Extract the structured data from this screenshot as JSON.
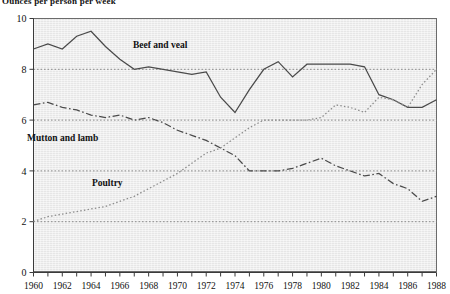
{
  "chart_data": {
    "type": "line",
    "title": "Ounces per person per week",
    "xlabel": "",
    "ylabel": "",
    "xlim": [
      1960,
      1988
    ],
    "ylim": [
      0,
      10
    ],
    "yticks": [
      0,
      2,
      4,
      6,
      8,
      10
    ],
    "xticks": [
      1960,
      1961,
      1962,
      1963,
      1964,
      1965,
      1966,
      1967,
      1968,
      1969,
      1970,
      1971,
      1972,
      1973,
      1974,
      1975,
      1976,
      1977,
      1978,
      1979,
      1980,
      1981,
      1982,
      1983,
      1984,
      1985,
      1986,
      1987,
      1988
    ],
    "xtick_labels": [
      "1960",
      "",
      "1962",
      "",
      "1964",
      "",
      "1966",
      "",
      "1968",
      "",
      "1970",
      "",
      "1972",
      "",
      "1974",
      "",
      "1976",
      "",
      "1978",
      "",
      "1980",
      "",
      "1982",
      "",
      "1984",
      "",
      "1986",
      "",
      "1988"
    ],
    "grid": true,
    "grid_axis": "y",
    "legend_position": "inline-annotations",
    "x": [
      1960,
      1961,
      1962,
      1963,
      1964,
      1965,
      1966,
      1967,
      1968,
      1969,
      1970,
      1971,
      1972,
      1973,
      1974,
      1975,
      1976,
      1977,
      1978,
      1979,
      1980,
      1981,
      1982,
      1983,
      1984,
      1985,
      1986,
      1987,
      1988
    ],
    "series": [
      {
        "name": "Beef and veal",
        "style": "solid",
        "color": "#4a4a4a",
        "values": [
          8.8,
          9.0,
          8.8,
          9.3,
          9.5,
          8.9,
          8.4,
          8.0,
          8.1,
          8.0,
          7.9,
          7.8,
          7.9,
          6.9,
          6.3,
          7.2,
          8.0,
          8.3,
          7.7,
          8.2,
          8.2,
          8.2,
          8.2,
          8.1,
          7.0,
          6.8,
          6.5,
          6.5,
          6.8
        ]
      },
      {
        "name": "Mutton and lamb",
        "style": "dash-dot",
        "color": "#4a4a4a",
        "values": [
          6.6,
          6.7,
          6.5,
          6.4,
          6.2,
          6.1,
          6.2,
          6.0,
          6.1,
          5.9,
          5.6,
          5.4,
          5.2,
          4.9,
          4.6,
          4.0,
          4.0,
          4.0,
          4.1,
          4.3,
          4.5,
          4.2,
          4.0,
          3.8,
          3.9,
          3.5,
          3.3,
          2.8,
          3.0
        ]
      },
      {
        "name": "Poultry",
        "style": "dotted",
        "color": "#8d8d8d",
        "values": [
          2.0,
          2.2,
          2.3,
          2.4,
          2.5,
          2.6,
          2.8,
          3.0,
          3.3,
          3.6,
          3.9,
          4.3,
          4.7,
          4.9,
          5.3,
          5.7,
          6.0,
          6.0,
          6.0,
          6.0,
          6.1,
          6.6,
          6.5,
          6.3,
          6.9,
          6.8,
          6.5,
          7.4,
          8.0
        ]
      }
    ],
    "annotations": [
      {
        "text": "Beef and veal",
        "x_px": 133,
        "y_px": 48
      },
      {
        "text": "Mutton and lamb",
        "x_px": 27,
        "y_px": 141
      },
      {
        "text": "Poultry",
        "x_px": 92,
        "y_px": 186
      }
    ]
  }
}
